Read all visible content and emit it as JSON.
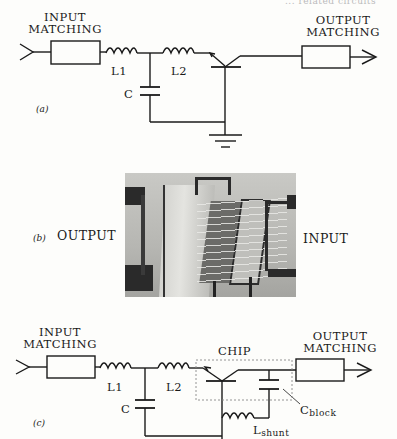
{
  "header": {
    "faint_caption": "... related circuits"
  },
  "figure_a": {
    "tag": "(a)",
    "input_matching": [
      "INPUT",
      "MATCHING"
    ],
    "output_matching": [
      "OUTPUT",
      "MATCHING"
    ],
    "l1": "L1",
    "l2": "L2",
    "c": "C"
  },
  "figure_b": {
    "tag": "(b)",
    "left_label": "OUTPUT",
    "right_label": "INPUT"
  },
  "figure_c": {
    "tag": "(c)",
    "input_matching": [
      "INPUT",
      "MATCHING"
    ],
    "output_matching": [
      "OUTPUT",
      "MATCHING"
    ],
    "l1": "L1",
    "l2": "L2",
    "c": "C",
    "chip": "CHIP",
    "c_block": {
      "main": "C",
      "sub": "block"
    },
    "l_shunt": {
      "main": "L",
      "sub": "shunt"
    }
  }
}
